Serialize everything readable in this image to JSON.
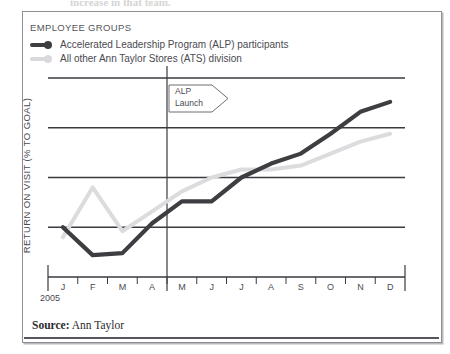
{
  "top_partial_text": "increase in that team.",
  "legend": {
    "title": "EMPLOYEE GROUPS",
    "items": [
      {
        "label": "Accelerated Leadership Program (ALP) participants",
        "color": "#3d3d42",
        "icon": "line-dot-marker"
      },
      {
        "label": "All other Ann Taylor Stores (ATS) division",
        "color": "#d9d9dc",
        "icon": "line-dot-marker"
      }
    ]
  },
  "annotation": {
    "line1": "ALP",
    "line2": "Launch",
    "shape": "arrow-banner"
  },
  "source": {
    "label": "Source:",
    "value": "Ann Taylor"
  },
  "colors": {
    "alp_line": "#3d3d42",
    "ats_line": "#dcdcdf",
    "gridline": "#3a3a3f",
    "axis": "#3a3a3f",
    "frame": "#8e8e94"
  },
  "chart_data": {
    "type": "line",
    "title": "",
    "subtitle": "",
    "xlabel": "",
    "ylabel": "RETURN ON VISIT (% TO GOAL)",
    "year": "2005",
    "categories": [
      "J",
      "F",
      "M",
      "A",
      "M",
      "J",
      "J",
      "A",
      "S",
      "O",
      "N",
      "D"
    ],
    "grid": true,
    "gridlines": 4,
    "axis_tick_labels": [],
    "ylim": [
      0,
      100
    ],
    "legend_position": "top-left",
    "annotations": [
      {
        "text": "ALP Launch",
        "x_category": "A",
        "x_boundary": "April/May",
        "type": "vertical-marker-with-banner"
      }
    ],
    "series": [
      {
        "name": "Accelerated Leadership Program (ALP) participants",
        "color": "#3d3d42",
        "values": [
          25,
          11,
          12,
          27,
          38,
          38,
          50,
          57,
          62,
          72,
          83,
          88
        ]
      },
      {
        "name": "All other Ann Taylor Stores (ATS) division",
        "color": "#dcdcdf",
        "values": [
          20,
          45,
          23,
          33,
          43,
          50,
          54,
          54,
          56,
          62,
          68,
          72
        ]
      }
    ]
  }
}
